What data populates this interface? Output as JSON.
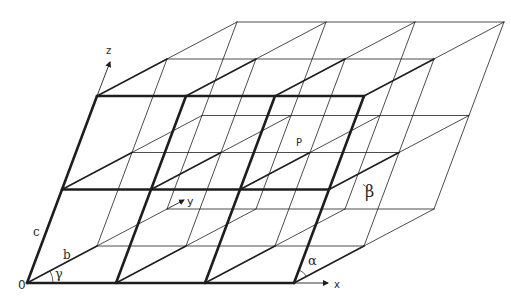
{
  "diagram": {
    "origin_px": [
      27,
      283
    ],
    "vectors_px": {
      "a": [
        89,
        0
      ],
      "b": [
        70,
        -37
      ],
      "c": [
        35,
        -93.5
      ]
    },
    "counts": {
      "a": 3,
      "b": 2,
      "c": 2
    },
    "colors": {
      "line": "#1e1e1e",
      "background": "#ffffff"
    },
    "stroke": {
      "thick": 2.6,
      "medium": 1.6,
      "thin": 0.8
    },
    "labels": {
      "origin": "0",
      "a": "a",
      "b": "b",
      "c": "c",
      "alpha": "α",
      "beta": "β",
      "gamma": "γ",
      "x_axis": "x",
      "y_axis": "y",
      "z_axis": "z",
      "point": "P"
    },
    "label_positions": {
      "origin": [
        18,
        289
      ],
      "a": [
        304,
        263
      ],
      "b": [
        63,
        259
      ],
      "c": [
        33,
        236
      ],
      "alpha": [
        308,
        265
      ],
      "beta": [
        365,
        197
      ],
      "gamma": [
        55,
        278
      ],
      "x_axis": [
        334,
        288
      ],
      "y_axis": [
        187,
        205
      ],
      "z_axis": [
        106,
        54
      ],
      "point": [
        296,
        146
      ]
    },
    "axes_px": {
      "x": {
        "from": [
          295,
          283
        ],
        "to": [
          328,
          283
        ]
      },
      "y": {
        "from": [
          167,
          209
        ],
        "to": [
          184,
          200
        ]
      },
      "z": {
        "from": [
          97,
          96
        ],
        "to": [
          110,
          62
        ]
      }
    }
  }
}
